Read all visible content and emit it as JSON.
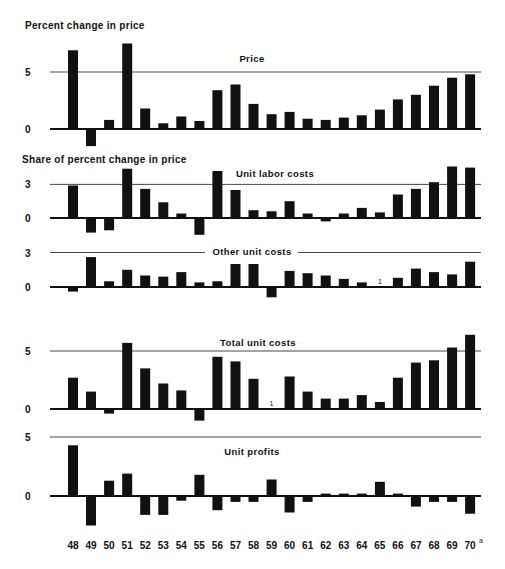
{
  "chart_data": {
    "type": "bar",
    "title": "Percent change in price",
    "subtitle": "Share of percent change in price",
    "xlabel": "",
    "ylabel": "Percent change in price",
    "categories": [
      "48",
      "49",
      "50",
      "51",
      "52",
      "53",
      "54",
      "55",
      "56",
      "57",
      "58",
      "59",
      "60",
      "61",
      "62",
      "63",
      "64",
      "65",
      "66",
      "67",
      "68",
      "69",
      "70"
    ],
    "category_footnote": {
      "index": 22,
      "mark": "a"
    },
    "grid": false,
    "legend": null,
    "panels": [
      {
        "name": "Price",
        "label": "Price",
        "yticks": [
          0,
          5
        ],
        "ref_line": 5,
        "values": [
          6.9,
          -1.5,
          0.8,
          7.5,
          1.8,
          0.5,
          1.1,
          0.7,
          3.4,
          3.9,
          2.2,
          1.3,
          1.5,
          0.9,
          0.8,
          1.0,
          1.2,
          1.7,
          2.6,
          3.0,
          3.8,
          4.5,
          4.8
        ],
        "footnote_markers": []
      },
      {
        "name": "Unit labor costs",
        "label": "Unit labor costs",
        "yticks": [
          0,
          3
        ],
        "ref_line": 3,
        "values": [
          2.9,
          -1.3,
          -1.1,
          4.4,
          2.6,
          1.4,
          0.4,
          -1.5,
          4.2,
          2.5,
          0.7,
          0.6,
          1.5,
          0.4,
          -0.3,
          0.4,
          0.9,
          0.5,
          2.1,
          2.6,
          3.2,
          4.6,
          4.5
        ],
        "footnote_markers": []
      },
      {
        "name": "Other unit costs",
        "label": "Other unit costs",
        "yticks": [
          0,
          3
        ],
        "ref_line": 3,
        "values": [
          -0.4,
          2.6,
          0.5,
          1.5,
          1.0,
          0.9,
          1.3,
          0.4,
          0.5,
          2.0,
          2.0,
          -0.9,
          1.4,
          1.2,
          1.0,
          0.7,
          0.4,
          0.0,
          0.8,
          1.6,
          1.3,
          1.1,
          2.2
        ],
        "footnote_markers": [
          {
            "index": 17,
            "mark": "1"
          }
        ]
      },
      {
        "name": "Total unit costs",
        "label": "Total unit costs",
        "yticks": [
          0,
          5
        ],
        "ref_line": 5,
        "values": [
          2.7,
          1.5,
          -0.4,
          5.7,
          3.5,
          2.2,
          1.6,
          -1.0,
          4.5,
          4.1,
          2.6,
          0.0,
          2.8,
          1.5,
          0.9,
          0.9,
          1.2,
          0.6,
          2.7,
          4.0,
          4.2,
          5.3,
          6.4
        ],
        "footnote_markers": [
          {
            "index": 11,
            "mark": "1"
          }
        ]
      },
      {
        "name": "Unit profits",
        "label": "Unit profits",
        "yticks": [
          0,
          5
        ],
        "ref_line": 5,
        "values": [
          4.3,
          -2.5,
          1.3,
          1.9,
          -1.6,
          -1.6,
          -0.4,
          1.8,
          -1.2,
          -0.5,
          -0.5,
          1.4,
          -1.4,
          -0.5,
          0.2,
          0.2,
          0.2,
          1.2,
          0.2,
          -0.9,
          -0.5,
          -0.5,
          -1.5
        ],
        "footnote_markers": []
      }
    ]
  },
  "labels": {
    "title": "Percent change in price",
    "subtitle": "Share of percent change in price",
    "x_footnote_sup": "a"
  },
  "colors": {
    "bar": "#111111",
    "axis": "#111111",
    "ref_line": "#333333",
    "background": "#ffffff"
  }
}
